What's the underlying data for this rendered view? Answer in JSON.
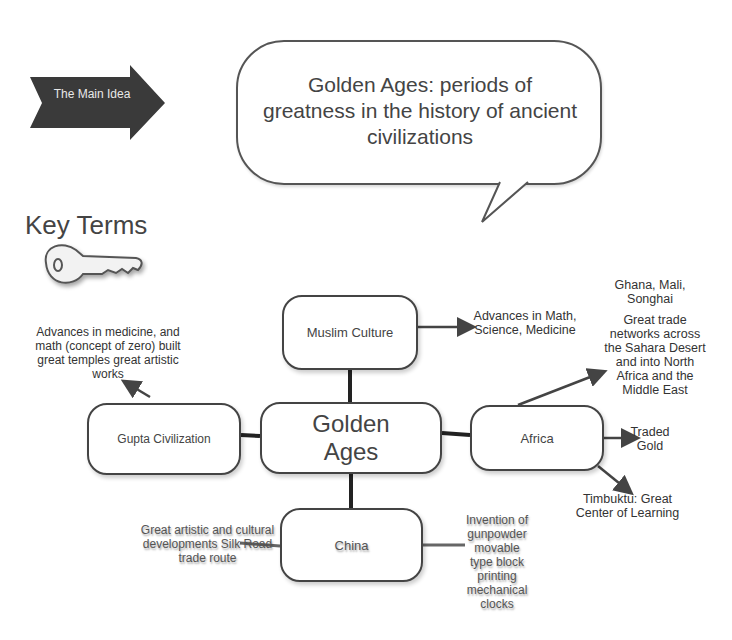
{
  "banner": {
    "label": "The Main Idea"
  },
  "bubble": {
    "text": "Golden Ages: periods of greatness in the history of ancient civilizations"
  },
  "key_terms": {
    "title": "Key Terms",
    "icon": "key-icon"
  },
  "nodes": {
    "center": "Golden Ages",
    "muslim": "Muslim Culture",
    "gupta": "Gupta Civilization",
    "africa": "Africa",
    "china": "China"
  },
  "notes": {
    "muslim": "Advances in Math, Science, Medicine",
    "gupta": "Advances in medicine, and math (concept of zero) built great temples great artistic works",
    "ghana": "Ghana, Mali, Songhai",
    "trade": "Great trade networks across the Sahara Desert and into North Africa and the Middle East",
    "gold": "Traded Gold",
    "timbuktu": "Timbuktu: Great Center of Learning",
    "china_left": "Great artistic and cultural developments Silk Road trade route",
    "china_right": "Invention of gunpowder movable type block printing mechanical clocks"
  }
}
